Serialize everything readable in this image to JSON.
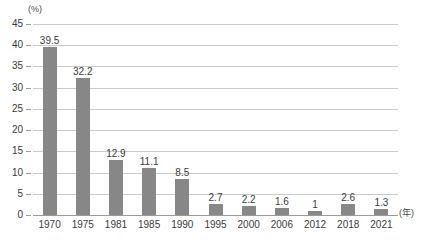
{
  "chart_data": {
    "type": "bar",
    "title": "",
    "subtitle": "",
    "xlabel": "(年)",
    "ylabel": "(%)",
    "categories": [
      "1970",
      "1975",
      "1981",
      "1985",
      "1990",
      "1995",
      "2000",
      "2006",
      "2012",
      "2018",
      "2021"
    ],
    "values": [
      39.5,
      32.2,
      12.9,
      11.1,
      8.5,
      2.7,
      2.2,
      1.6,
      1,
      2.6,
      1.3
    ],
    "value_labels": [
      "39.5",
      "32.2",
      "12.9",
      "11.1",
      "8.5",
      "2.7",
      "2.2",
      "1.6",
      "1",
      "2.6",
      "1.3"
    ],
    "ylim": [
      0,
      45
    ],
    "ytick_values": [
      0,
      5,
      10,
      15,
      20,
      25,
      30,
      35,
      40,
      45
    ],
    "ytick_labels": [
      "0",
      "5",
      "10",
      "15",
      "20",
      "25",
      "30",
      "35",
      "40",
      "45"
    ],
    "grid": true,
    "legend": null,
    "legend_position": "none",
    "series": [
      {
        "name": "",
        "values": [
          39.5,
          32.2,
          12.9,
          11.1,
          8.5,
          2.7,
          2.2,
          1.6,
          1,
          2.6,
          1.3
        ]
      }
    ]
  },
  "colors": {
    "bar": "#878787",
    "gridline": "#c9c9c9",
    "baseline": "#9a9a9a",
    "text": "#3a3a3a",
    "background": "#ffffff"
  }
}
